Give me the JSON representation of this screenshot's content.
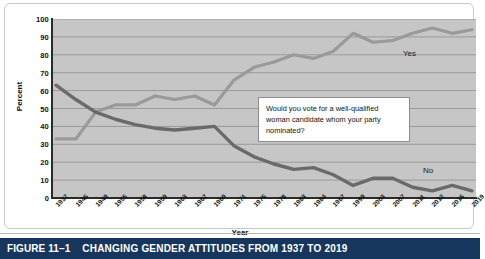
{
  "figure": {
    "number": "FIGURE 11–1",
    "title": "CHANGING GENDER ATTITUDES FROM 1937 TO 2019"
  },
  "annotation": {
    "text": "Would you vote for a well-qualified woman candidate whom your party nominated?"
  },
  "labels": {
    "yes": "Yes",
    "no": "No"
  },
  "chart_data": {
    "type": "line",
    "title": "CHANGING GENDER ATTITUDES FROM 1937 TO 2019",
    "xlabel": "Year",
    "ylabel": "Percent",
    "ylim": [
      0,
      100
    ],
    "ytick_values": [
      0,
      10,
      20,
      30,
      40,
      50,
      60,
      70,
      80,
      90,
      100
    ],
    "grid": true,
    "legend": "inline-series-labels",
    "annotations": [
      "Would you vote for a well-qualified woman candidate whom your party nominated?"
    ],
    "categories": [
      "1937",
      "1945",
      "1949",
      "1955",
      "1958",
      "1959",
      "1963",
      "1967",
      "1969",
      "1971",
      "1975",
      "1978",
      "1983",
      "1984",
      "1987",
      "1999",
      "2003",
      "2007",
      "2011",
      "2012",
      "2015",
      "2019"
    ],
    "series": [
      {
        "name": "Yes",
        "color": "#9a9a9a",
        "values": [
          33,
          33,
          48,
          52,
          52,
          57,
          55,
          57,
          52,
          66,
          73,
          76,
          80,
          78,
          82,
          92,
          87,
          88,
          92,
          95,
          92,
          94
        ]
      },
      {
        "name": "No",
        "color": "#6a6a6a",
        "values": [
          63,
          55,
          48,
          44,
          41,
          39,
          38,
          39,
          40,
          29,
          23,
          19,
          16,
          17,
          13,
          7,
          11,
          11,
          6,
          4,
          7,
          4
        ]
      }
    ]
  }
}
